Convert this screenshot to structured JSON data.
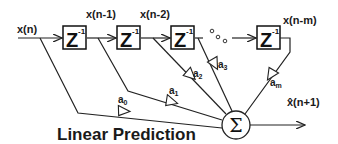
{
  "diagram": {
    "title": "Linear Prediction",
    "input_label": "x(n)",
    "delay_label": "Z",
    "delay_exponent": "-1",
    "tap_labels": [
      "x(n-1)",
      "x(n-2)",
      "x(n-m)"
    ],
    "ellipsis": "° ° °",
    "coefficients": [
      {
        "letter": "a",
        "sub": "0"
      },
      {
        "letter": "a",
        "sub": "1"
      },
      {
        "letter": "a",
        "sub": "2"
      },
      {
        "letter": "a",
        "sub": "3"
      },
      {
        "letter": "a",
        "sub": "m"
      }
    ],
    "summer_symbol": "Σ",
    "output_label": "x̂(n+1)"
  }
}
